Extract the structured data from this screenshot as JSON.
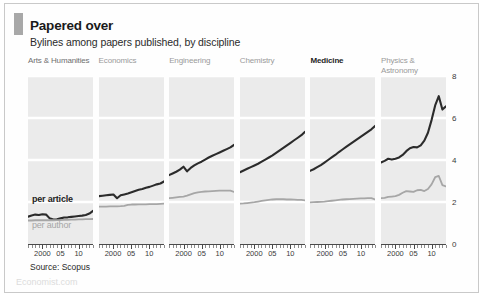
{
  "figure": {
    "title": "Papered over",
    "subtitle": "Bylines among papers published, by discipline",
    "source": "Source: Scopus",
    "watermark": "Economist.com",
    "accent_color": "#a8a8a8",
    "panel_background": "#ebebeb",
    "series_colors": {
      "per_article": "#2b2b2b",
      "per_author": "#a6a6a6"
    }
  },
  "legend": {
    "per_article_label": "per article",
    "per_author_label": "per author"
  },
  "chart_data": {
    "type": "line",
    "title": "Papered over",
    "subtitle": "Bylines among papers published, by discipline",
    "xlabel": "",
    "ylabel": "",
    "ylim": [
      0,
      8
    ],
    "yticks": [
      0,
      2,
      4,
      6,
      8
    ],
    "ytick_labels": [
      "0",
      "2",
      "4",
      "6",
      "8"
    ],
    "xlim": [
      1996,
      2014
    ],
    "xticks": [
      2000,
      2005,
      2010
    ],
    "xtick_labels": [
      "2000",
      "05",
      "10"
    ],
    "grid": true,
    "legend_position": "inline-left-panel",
    "source": "Source: Scopus",
    "x": [
      1996,
      1997,
      1998,
      1999,
      2000,
      2001,
      2002,
      2003,
      2004,
      2005,
      2006,
      2007,
      2008,
      2009,
      2010,
      2011,
      2012,
      2013,
      2014
    ],
    "panels": [
      {
        "name": "Arts & Humanities",
        "emphasis": "semi",
        "series": [
          {
            "name": "per article",
            "values": [
              1.3,
              1.36,
              1.4,
              1.38,
              1.42,
              1.4,
              1.22,
              1.17,
              1.18,
              1.22,
              1.26,
              1.27,
              1.29,
              1.31,
              1.33,
              1.35,
              1.38,
              1.45,
              1.58
            ]
          },
          {
            "name": "per author",
            "values": [
              1.12,
              1.12,
              1.13,
              1.13,
              1.13,
              1.14,
              1.13,
              1.13,
              1.14,
              1.14,
              1.15,
              1.15,
              1.16,
              1.16,
              1.17,
              1.17,
              1.18,
              1.18,
              1.19
            ]
          }
        ]
      },
      {
        "name": "Economics",
        "emphasis": "muted",
        "series": [
          {
            "name": "per article",
            "values": [
              2.28,
              2.3,
              2.32,
              2.34,
              2.36,
              2.18,
              2.32,
              2.36,
              2.4,
              2.46,
              2.52,
              2.58,
              2.62,
              2.68,
              2.72,
              2.78,
              2.84,
              2.88,
              2.98
            ]
          },
          {
            "name": "per author",
            "values": [
              1.78,
              1.78,
              1.78,
              1.79,
              1.79,
              1.79,
              1.8,
              1.82,
              1.86,
              1.88,
              1.88,
              1.89,
              1.89,
              1.89,
              1.9,
              1.9,
              1.9,
              1.91,
              1.92
            ]
          }
        ]
      },
      {
        "name": "Engineering",
        "emphasis": "muted",
        "series": [
          {
            "name": "per article",
            "values": [
              3.28,
              3.36,
              3.44,
              3.54,
              3.68,
              3.46,
              3.62,
              3.74,
              3.84,
              3.92,
              4.02,
              4.12,
              4.2,
              4.28,
              4.36,
              4.44,
              4.52,
              4.6,
              4.72
            ]
          },
          {
            "name": "per author",
            "values": [
              2.18,
              2.2,
              2.22,
              2.24,
              2.26,
              2.3,
              2.36,
              2.42,
              2.46,
              2.48,
              2.5,
              2.51,
              2.52,
              2.53,
              2.54,
              2.54,
              2.54,
              2.54,
              2.48
            ]
          }
        ]
      },
      {
        "name": "Chemistry",
        "emphasis": "muted",
        "series": [
          {
            "name": "per article",
            "values": [
              3.42,
              3.5,
              3.58,
              3.66,
              3.74,
              3.82,
              3.92,
              4.02,
              4.12,
              4.22,
              4.34,
              4.46,
              4.58,
              4.7,
              4.82,
              4.94,
              5.06,
              5.18,
              5.34
            ]
          },
          {
            "name": "per author",
            "values": [
              1.92,
              1.93,
              1.95,
              1.97,
              1.99,
              2.02,
              2.05,
              2.08,
              2.1,
              2.12,
              2.13,
              2.13,
              2.13,
              2.12,
              2.12,
              2.11,
              2.1,
              2.1,
              2.08
            ]
          }
        ]
      },
      {
        "name": "Medicine",
        "emphasis": "highlight",
        "series": [
          {
            "name": "per article",
            "values": [
              3.48,
              3.56,
              3.66,
              3.76,
              3.88,
              4.0,
              4.12,
              4.24,
              4.38,
              4.5,
              4.62,
              4.74,
              4.86,
              4.98,
              5.1,
              5.22,
              5.34,
              5.46,
              5.62
            ]
          },
          {
            "name": "per author",
            "values": [
              1.98,
              1.99,
              2.0,
              2.01,
              2.02,
              2.04,
              2.06,
              2.08,
              2.1,
              2.12,
              2.13,
              2.14,
              2.15,
              2.16,
              2.17,
              2.17,
              2.18,
              2.18,
              2.12
            ]
          }
        ]
      },
      {
        "name": "Physics & Astronomy",
        "emphasis": "muted",
        "series": [
          {
            "name": "per article",
            "values": [
              3.88,
              3.96,
              4.06,
              4.02,
              4.06,
              4.12,
              4.24,
              4.42,
              4.56,
              4.62,
              4.6,
              4.7,
              4.92,
              5.3,
              5.9,
              6.6,
              7.04,
              6.4,
              6.56
            ]
          },
          {
            "name": "per author",
            "values": [
              2.18,
              2.2,
              2.24,
              2.26,
              2.28,
              2.34,
              2.44,
              2.52,
              2.5,
              2.48,
              2.56,
              2.58,
              2.52,
              2.62,
              2.84,
              3.18,
              3.24,
              2.8,
              2.74
            ]
          }
        ]
      }
    ]
  }
}
